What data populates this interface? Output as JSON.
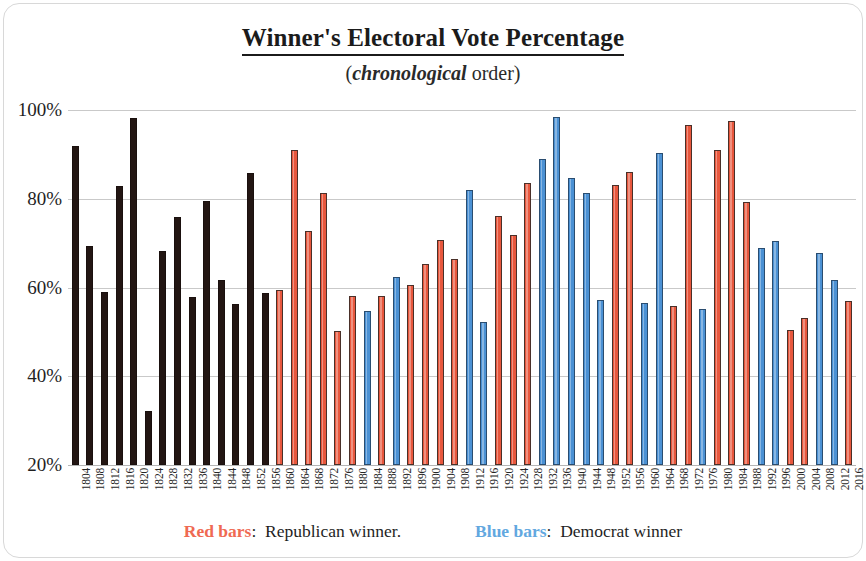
{
  "chart": {
    "title": "Winner's Electoral Vote Percentage",
    "subtitle_italic": "chronological",
    "subtitle_prefix": "(",
    "subtitle_suffix": " order)"
  },
  "legend": {
    "red_key": "Red bars",
    "red_sep": ":",
    "red_desc": "Republican winner.",
    "blue_key": "Blue bars",
    "blue_sep": ":",
    "blue_desc": "Democrat winner",
    "red_color": "#ef6a52",
    "blue_color": "#62a8e0"
  },
  "colors": {
    "bar_black": "#231613",
    "bar_red": "#e8573d",
    "bar_blue": "#4b91d4",
    "gridline": "#c9c9c9",
    "frame": "#d8d8d8"
  },
  "chart_data": {
    "type": "bar",
    "title": "Winner's Electoral Vote Percentage",
    "subtitle": "(chronological order)",
    "xlabel": "",
    "ylabel": "",
    "ylim": [
      20,
      100
    ],
    "ytick_labels": [
      "20%",
      "40%",
      "60%",
      "80%",
      "100%"
    ],
    "yticks": [
      20,
      40,
      60,
      80,
      100
    ],
    "grid": true,
    "legend_position": "bottom",
    "categories": [
      "1804",
      "1808",
      "1812",
      "1816",
      "1820",
      "1824",
      "1828",
      "1832",
      "1836",
      "1840",
      "1844",
      "1848",
      "1852",
      "1856",
      "1860",
      "1864",
      "1868",
      "1872",
      "1876",
      "1880",
      "1884",
      "1888",
      "1892",
      "1896",
      "1900",
      "1904",
      "1908",
      "1912",
      "1916",
      "1920",
      "1924",
      "1928",
      "1932",
      "1936",
      "1940",
      "1944",
      "1948",
      "1952",
      "1956",
      "1960",
      "1964",
      "1968",
      "1972",
      "1976",
      "1980",
      "1984",
      "1988",
      "1992",
      "1996",
      "2000",
      "2004",
      "2008",
      "2012",
      "2016"
    ],
    "values": [
      92.0,
      69.3,
      59.0,
      82.8,
      98.3,
      32.2,
      68.2,
      76.0,
      57.8,
      79.6,
      61.8,
      56.2,
      85.8,
      58.8,
      59.4,
      91.0,
      72.8,
      81.3,
      50.1,
      58.0,
      54.6,
      58.1,
      62.4,
      60.6,
      65.3,
      70.6,
      66.5,
      81.9,
      52.2,
      76.1,
      71.9,
      83.6,
      88.9,
      98.5,
      84.6,
      81.4,
      57.1,
      83.2,
      86.1,
      56.4,
      90.3,
      55.9,
      96.7,
      55.2,
      90.9,
      97.6,
      79.2,
      68.8,
      70.4,
      50.4,
      53.2,
      67.8,
      61.7,
      56.9
    ],
    "bar_colors": [
      "black",
      "black",
      "black",
      "black",
      "black",
      "black",
      "black",
      "black",
      "black",
      "black",
      "black",
      "black",
      "black",
      "black",
      "red",
      "red",
      "red",
      "red",
      "red",
      "red",
      "blue",
      "red",
      "blue",
      "red",
      "red",
      "red",
      "red",
      "blue",
      "blue",
      "red",
      "red",
      "red",
      "blue",
      "blue",
      "blue",
      "blue",
      "blue",
      "red",
      "red",
      "blue",
      "blue",
      "red",
      "red",
      "blue",
      "red",
      "red",
      "red",
      "blue",
      "blue",
      "red",
      "red",
      "blue",
      "blue",
      "red"
    ],
    "series": [
      {
        "name": "Winner's electoral vote percentage",
        "values": [
          92.0,
          69.3,
          59.0,
          82.8,
          98.3,
          32.2,
          68.2,
          76.0,
          57.8,
          79.6,
          61.8,
          56.2,
          85.8,
          58.8,
          59.4,
          91.0,
          72.8,
          81.3,
          50.1,
          58.0,
          54.6,
          58.1,
          62.4,
          60.6,
          65.3,
          70.6,
          66.5,
          81.9,
          52.2,
          76.1,
          71.9,
          83.6,
          88.9,
          98.5,
          84.6,
          81.4,
          57.1,
          83.2,
          86.1,
          56.4,
          90.3,
          55.9,
          96.7,
          55.2,
          90.9,
          97.6,
          79.2,
          68.8,
          70.4,
          50.4,
          53.2,
          67.8,
          61.7,
          56.9
        ]
      }
    ]
  }
}
